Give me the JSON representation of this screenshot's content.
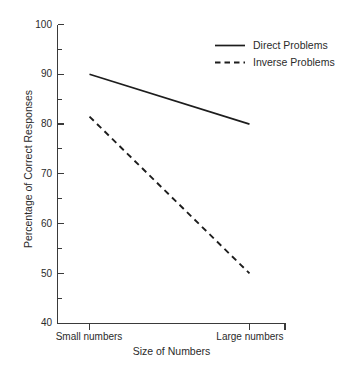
{
  "chart_data": {
    "type": "line",
    "title": "",
    "xlabel": "Size of Numbers",
    "ylabel": "Percentage of Correct Responses",
    "categories": [
      "Small numbers",
      "Large numbers"
    ],
    "x": [
      0,
      1
    ],
    "xlim": [
      0,
      1.225
    ],
    "ylim": [
      40,
      100
    ],
    "yticks": [
      40,
      50,
      60,
      70,
      80,
      90,
      100
    ],
    "yticks_minor": [
      45,
      55,
      65,
      75,
      85,
      95
    ],
    "ytick_labels": [
      "40",
      "50",
      "60",
      "70",
      "80",
      "90",
      "100"
    ],
    "grid": false,
    "legend_position": "top-right",
    "series": [
      {
        "name": "Direct Problems",
        "style": "solid",
        "color": "#1d1d1d",
        "values": [
          90,
          80
        ]
      },
      {
        "name": "Inverse Problems",
        "style": "dashed",
        "color": "#1d1d1d",
        "values": [
          81.5,
          50
        ]
      }
    ]
  },
  "axes": {
    "y_label_text": "Percentage of Correct Responses",
    "x_label_text": "Size of Numbers",
    "y_tick_0": "100",
    "y_tick_1": "90",
    "y_tick_2": "80",
    "y_tick_3": "70",
    "y_tick_4": "60",
    "y_tick_5": "50",
    "y_tick_6": "40",
    "x_tick_0": "Small numbers",
    "x_tick_1": "Large numbers"
  },
  "legend": {
    "entry_0_label": "Direct Problems",
    "entry_1_label": "Inverse Problems"
  }
}
